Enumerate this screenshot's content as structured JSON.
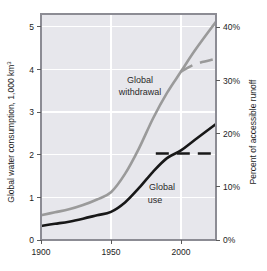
{
  "chart_data": {
    "type": "line",
    "title": "",
    "subtitle": "",
    "ylabel": "Global water consumption, 1,000 km",
    "ylabel_sup": "3",
    "ylabel_full": "Global water consumption, 1,000 km3",
    "y2label": "Percent of accessible runoff",
    "xlabel": "",
    "xlim": [
      1900,
      2025
    ],
    "ylim": [
      0,
      5.3
    ],
    "y2lim": [
      0,
      42.5
    ],
    "grid": true,
    "grid_color": "#ffffff",
    "plot_background": "#e7e7ec",
    "legend_position": "inline-annotations",
    "xticks": [
      1900,
      1950,
      2000
    ],
    "xtick_labels": [
      "1900",
      "1950",
      "2000"
    ],
    "yticks": [
      0,
      1,
      2,
      3,
      4,
      5
    ],
    "ytick_labels": [
      "0",
      "1",
      "2",
      "3",
      "4",
      "5"
    ],
    "y2ticks": [
      0,
      10,
      20,
      30,
      40
    ],
    "y2tick_labels": [
      "0%",
      "10%",
      "20%",
      "30%",
      "40%"
    ],
    "annotations": [
      {
        "text_line1": "Global",
        "text_line2": "withdrawal",
        "x": 1958,
        "y": 3.95
      },
      {
        "text_line1": "Global",
        "text_line2": "use",
        "x": 1978,
        "y": 1.35
      }
    ],
    "series": [
      {
        "name": "Global withdrawal",
        "color": "#9a9a9a",
        "style": "solid",
        "width": 2.6,
        "x": [
          1900,
          1910,
          1920,
          1930,
          1940,
          1950,
          1960,
          1970,
          1980,
          1990,
          2000,
          2010,
          2025
        ],
        "values": [
          0.58,
          0.65,
          0.72,
          0.82,
          0.95,
          1.12,
          1.55,
          2.15,
          2.85,
          3.45,
          3.95,
          4.45,
          5.12
        ]
      },
      {
        "name": "Global withdrawal (projected low)",
        "color": "#9a9a9a",
        "style": "dashed",
        "width": 2.6,
        "x": [
          2000,
          2010,
          2025
        ],
        "values": [
          3.95,
          4.12,
          4.25
        ]
      },
      {
        "name": "Global use",
        "color": "#181818",
        "style": "solid",
        "width": 2.6,
        "x": [
          1900,
          1910,
          1920,
          1930,
          1940,
          1950,
          1960,
          1970,
          1980,
          1990,
          2000,
          2010,
          2025
        ],
        "values": [
          0.33,
          0.38,
          0.43,
          0.5,
          0.58,
          0.66,
          0.88,
          1.22,
          1.6,
          1.92,
          2.1,
          2.35,
          2.72
        ]
      },
      {
        "name": "Global use (projected low)",
        "color": "#181818",
        "style": "dashed",
        "width": 2.6,
        "x": [
          1982,
          2025
        ],
        "values": [
          2.03,
          2.03
        ]
      }
    ]
  },
  "axes": {
    "left": {
      "title": "Global water consumption, 1,000 km",
      "title_superscript": "3",
      "ticks": [
        "5",
        "4",
        "3",
        "2",
        "1",
        "0"
      ]
    },
    "right": {
      "title": "Percent of accessible runoff",
      "ticks": [
        "40%",
        "30%",
        "20%",
        "10%",
        "0%"
      ]
    },
    "bottom": {
      "ticks": [
        "1900",
        "1950",
        "2000"
      ]
    }
  },
  "labels": {
    "withdrawal_line1": "Global",
    "withdrawal_line2": "withdrawal",
    "use_line1": "Global",
    "use_line2": "use"
  },
  "colors": {
    "withdrawal": "#9a9a9a",
    "use": "#181818",
    "plot_bg": "#e7e7ec",
    "grid": "#ffffff",
    "frame": "#8c8c94",
    "text": "#1c1c1c"
  }
}
